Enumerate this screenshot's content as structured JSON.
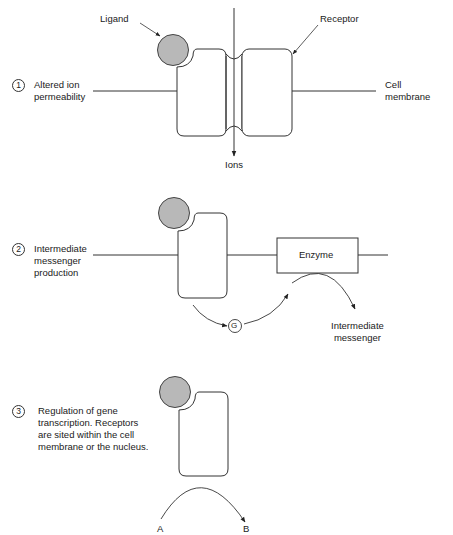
{
  "colors": {
    "line": "#333333",
    "ligand_fill": "#b8b8b8",
    "ligand_stroke": "#444444",
    "background": "#ffffff"
  },
  "icons": {
    "ligand": "ligand-circle-icon",
    "receptor": "receptor-block-icon",
    "g_protein": "g-protein-circle-icon",
    "arrow": "arrow-icon"
  },
  "panel1": {
    "number": "1",
    "title": "Altered ion\npermeability",
    "ligand_label": "Ligand",
    "receptor_label": "Receptor",
    "membrane_label": "Cell\nmembrane",
    "ions_label": "Ions"
  },
  "panel2": {
    "number": "2",
    "title": "Intermediate\nmessenger\nproduction",
    "enzyme_label": "Enzyme",
    "g_label": "G",
    "output_label": "Intermediate\nmessenger"
  },
  "panel3": {
    "number": "3",
    "title": "Regulation of gene\ntranscription. Receptors\nare sited within the cell\nmembrane or the nucleus.",
    "from_label": "A",
    "to_label": "B"
  }
}
